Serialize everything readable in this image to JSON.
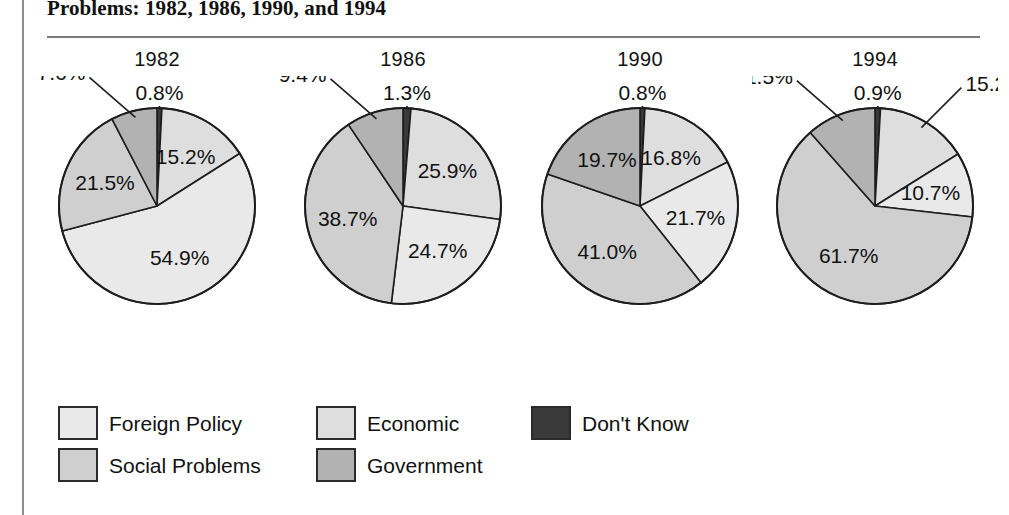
{
  "figure": {
    "title": "Problems: 1982, 1986, 1990, and 1994",
    "title_note": "heading is clipped by the top edge of the scan"
  },
  "legend": {
    "entries": [
      {
        "label": "Foreign Policy",
        "color": "#e9e9e9",
        "row": 0,
        "col": 0
      },
      {
        "label": "Economic",
        "color": "#dedede",
        "row": 0,
        "col": 1
      },
      {
        "label": "Don't Know",
        "color": "#3a3a3a",
        "row": 0,
        "col": 2
      },
      {
        "label": "Social Problems",
        "color": "#cfcfcf",
        "row": 1,
        "col": 0
      },
      {
        "label": "Government",
        "color": "#b2b2b2",
        "row": 1,
        "col": 1
      }
    ]
  },
  "chart_data": {
    "type": "pie",
    "title": "Problems: 1982, 1986, 1990, and 1994",
    "subtitle": "",
    "xlabel": "",
    "ylabel": "",
    "units": "percent",
    "grid": false,
    "legend_position": "bottom-left",
    "slice_order_clockwise_from_top": [
      "Don't Know",
      "Economic",
      "Foreign Policy",
      "Social Problems",
      "Government"
    ],
    "categories": [
      "Foreign Policy",
      "Economic",
      "Don't Know",
      "Social Problems",
      "Government"
    ],
    "category_colors": {
      "Foreign Policy": "#e9e9e9",
      "Economic": "#dedede",
      "Don't Know": "#3a3a3a",
      "Social Problems": "#cfcfcf",
      "Government": "#b2b2b2"
    },
    "panels": [
      {
        "title": "1982",
        "slices": [
          {
            "name": "Don't Know",
            "value": 0.8,
            "label": "0.8%",
            "label_placement": "outside-top"
          },
          {
            "name": "Economic",
            "value": 15.2,
            "label": "15.2%",
            "label_placement": "inside"
          },
          {
            "name": "Foreign Policy",
            "value": 54.9,
            "label": "54.9%",
            "label_placement": "inside"
          },
          {
            "name": "Social Problems",
            "value": 21.5,
            "label": "21.5%",
            "label_placement": "inside"
          },
          {
            "name": "Government",
            "value": 7.6,
            "label": "7.6%",
            "label_placement": "outside-upper-left"
          }
        ]
      },
      {
        "title": "1986",
        "slices": [
          {
            "name": "Don't Know",
            "value": 1.3,
            "label": "1.3%",
            "label_placement": "outside-top"
          },
          {
            "name": "Economic",
            "value": 25.9,
            "label": "25.9%",
            "label_placement": "inside"
          },
          {
            "name": "Foreign Policy",
            "value": 24.7,
            "label": "24.7%",
            "label_placement": "inside"
          },
          {
            "name": "Social Problems",
            "value": 38.7,
            "label": "38.7%",
            "label_placement": "inside"
          },
          {
            "name": "Government",
            "value": 9.4,
            "label": "9.4%",
            "label_placement": "outside-upper-left"
          }
        ]
      },
      {
        "title": "1990",
        "slices": [
          {
            "name": "Don't Know",
            "value": 0.8,
            "label": "0.8%",
            "label_placement": "outside-top"
          },
          {
            "name": "Economic",
            "value": 16.8,
            "label": "16.8%",
            "label_placement": "inside"
          },
          {
            "name": "Foreign Policy",
            "value": 21.7,
            "label": "21.7%",
            "label_placement": "inside"
          },
          {
            "name": "Social Problems",
            "value": 41.0,
            "label": "41.0%",
            "label_placement": "inside"
          },
          {
            "name": "Government",
            "value": 19.7,
            "label": "19.7%",
            "label_placement": "inside"
          }
        ]
      },
      {
        "title": "1994",
        "slices": [
          {
            "name": "Don't Know",
            "value": 0.9,
            "label": "0.9%",
            "label_placement": "outside-top"
          },
          {
            "name": "Economic",
            "value": 15.2,
            "label": "15.2%",
            "label_placement": "outside-upper-right"
          },
          {
            "name": "Foreign Policy",
            "value": 10.7,
            "label": "10.7%",
            "label_placement": "inside"
          },
          {
            "name": "Social Problems",
            "value": 61.7,
            "label": "61.7%",
            "label_placement": "inside"
          },
          {
            "name": "Government",
            "value": 11.5,
            "label": "11.5%",
            "label_placement": "outside-upper-left"
          }
        ]
      }
    ]
  }
}
